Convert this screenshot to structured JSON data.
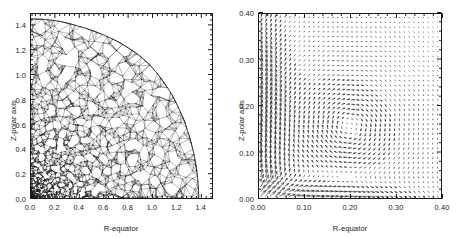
{
  "figure": {
    "background_color": "#ffffff",
    "ink_color": "#1a1a1a",
    "width": 458,
    "height": 238,
    "panel_count": 2
  },
  "chart_data": [
    {
      "type": "scatter",
      "render_style": "triangular-mesh",
      "title": "",
      "xlabel": "R-equator",
      "ylabel": "Z-polar axis",
      "xlim": [
        0.0,
        1.5
      ],
      "ylim": [
        0.0,
        1.5
      ],
      "xticks": [
        0.0,
        0.2,
        0.4,
        0.6,
        0.8,
        1.0,
        1.2,
        1.4
      ],
      "yticks": [
        0.0,
        0.2,
        0.4,
        0.6,
        0.8,
        1.0,
        1.2,
        1.4
      ],
      "xtick_labels": [
        "0.0",
        "0.2",
        "0.4",
        "0.6",
        "0.8",
        "1.0",
        "1.2",
        "1.4"
      ],
      "ytick_labels": [
        "0.0",
        "0.2",
        "0.4",
        "0.6",
        "0.8",
        "1.0",
        "1.2",
        "1.4"
      ],
      "grid": false,
      "legend": "none",
      "minor_ticks": true,
      "description": "Unstructured triangular finite-element mesh filling the quadrant of an oblate axisymmetric body. Mesh is extremely fine near the origin (lower-left, R and Z near 0) and coarsens outward toward the curved free surface.",
      "domain_boundary": {
        "note": "Outer free-surface curve of the meshed body, traced as (R,Z) pairs in data units",
        "points": [
          [
            0.0,
            1.46
          ],
          [
            0.12,
            1.455
          ],
          [
            0.24,
            1.44
          ],
          [
            0.36,
            1.41
          ],
          [
            0.48,
            1.375
          ],
          [
            0.6,
            1.33
          ],
          [
            0.72,
            1.275
          ],
          [
            0.82,
            1.215
          ],
          [
            0.9,
            1.16
          ],
          [
            0.98,
            1.09
          ],
          [
            1.05,
            1.01
          ],
          [
            1.11,
            0.93
          ],
          [
            1.17,
            0.84
          ],
          [
            1.22,
            0.74
          ],
          [
            1.27,
            0.63
          ],
          [
            1.31,
            0.51
          ],
          [
            1.345,
            0.38
          ],
          [
            1.37,
            0.25
          ],
          [
            1.385,
            0.12
          ],
          [
            1.39,
            0.0
          ]
        ]
      },
      "mesh_refinement": {
        "finest_region": "origin corner, R<0.35 and Z<0.35",
        "coarsest_region": "outer surface near R~1.0-1.2, Z~0.4-1.0"
      }
    },
    {
      "type": "scatter",
      "render_style": "vector-field-quiver",
      "title": "",
      "xlabel": "R-equator",
      "ylabel": "Z-polar axis",
      "xlim": [
        0.0,
        0.4
      ],
      "ylim": [
        0.0,
        0.4
      ],
      "xticks": [
        0.0,
        0.1,
        0.2,
        0.3,
        0.4
      ],
      "yticks": [
        0.0,
        0.1,
        0.2,
        0.3,
        0.4
      ],
      "xtick_labels": [
        "0.00",
        "0.10",
        "0.20",
        "0.30",
        "0.40"
      ],
      "ytick_labels": [
        "0.00",
        "0.10",
        "0.20",
        "0.30",
        "0.40"
      ],
      "grid": false,
      "legend": "none",
      "minor_ticks": true,
      "description": "Meridional velocity vector field on a regular grid. A strong clockwise circulation cell (vortex) is centred near (R=0.20, Z=0.155); arrow magnitude is largest along the rotation axis R~0.03-0.10 and near the equatorial plane Z~0.02-0.10, and decays to near zero toward the upper-right corner.",
      "vortex_center": {
        "R": 0.2,
        "Z": 0.155
      },
      "circulation_sense": "clockwise",
      "grid_spacing": 0.01,
      "max_arrow_region": "R<0.10 along the polar axis and Z<0.10 along the equator",
      "min_arrow_region": "upper-right corner R>0.30, Z>0.30"
    }
  ],
  "panels": [
    {
      "id": "mesh-panel",
      "xlabel": "R-equator",
      "ylabel": "Z-polar axis",
      "xtick_labels": [
        "0.0",
        "0.2",
        "0.4",
        "0.6",
        "0.8",
        "1.0",
        "1.2",
        "1.4"
      ],
      "ytick_labels": [
        "0.0",
        "0.2",
        "0.4",
        "0.6",
        "0.8",
        "1.0",
        "1.2",
        "1.4"
      ]
    },
    {
      "id": "velocity-panel",
      "xlabel": "R-equator",
      "ylabel": "Z-polar axis",
      "xtick_labels": [
        "0.00",
        "0.10",
        "0.20",
        "0.30",
        "0.40"
      ],
      "ytick_labels": [
        "0.00",
        "0.10",
        "0.20",
        "0.30",
        "0.40"
      ]
    }
  ]
}
